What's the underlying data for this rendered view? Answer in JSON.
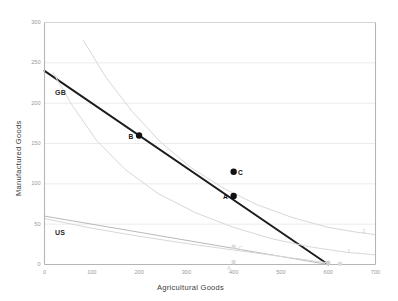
{
  "chart_data": {
    "type": "line",
    "title": "",
    "xlabel": "Agricultural Goods",
    "ylabel": "Manufactured Goods",
    "xlim": [
      0,
      700
    ],
    "ylim": [
      0,
      300
    ],
    "xticks": [
      "0",
      "100",
      "200",
      "300",
      "400",
      "500",
      "600",
      "700"
    ],
    "yticks": [
      "0",
      "50",
      "100",
      "150",
      "200",
      "250",
      "300"
    ],
    "grid": "horizontal",
    "legend": "none",
    "series": [
      {
        "name": "GB",
        "label": "GB",
        "kind": "ppf-line",
        "color": "#1c1c1c",
        "x": [
          0,
          600
        ],
        "y": [
          240,
          0
        ]
      },
      {
        "name": "US",
        "label": "US",
        "kind": "ppf-line",
        "color": "#b9b9b9",
        "x": [
          0,
          600
        ],
        "y": [
          60,
          0
        ]
      },
      {
        "name": "indifference-curve-1",
        "label": "1",
        "kind": "indifference-curve",
        "color": "#d8d8d8",
        "x": [
          18,
          60,
          110,
          170,
          240,
          320,
          400,
          480,
          560,
          640,
          700
        ],
        "y": [
          238,
          196,
          154,
          118,
          88,
          64,
          46,
          32,
          22,
          15,
          12
        ]
      },
      {
        "name": "indifference-curve-2",
        "label": "2",
        "kind": "indifference-curve",
        "color": "#d8d8d8",
        "x": [
          82,
          130,
          185,
          245,
          310,
          380,
          450,
          525,
          600,
          660,
          700
        ],
        "y": [
          278,
          232,
          190,
          152,
          120,
          94,
          74,
          58,
          46,
          40,
          37
        ]
      },
      {
        "name": "us-lower-curve",
        "label": "",
        "kind": "indifference-curve",
        "color": "#d8d8d8",
        "x": [
          0,
          100,
          200,
          300,
          400,
          500,
          600
        ],
        "y": [
          57,
          45,
          35,
          26,
          18,
          10,
          2
        ]
      }
    ],
    "points": [
      {
        "name": "point-B",
        "label": "B",
        "x": 200,
        "y": 160,
        "color": "#111111",
        "label_side": "left"
      },
      {
        "name": "point-A",
        "label": "A",
        "x": 400,
        "y": 85,
        "color": "#111111",
        "label_side": "left"
      },
      {
        "name": "point-C",
        "label": "C",
        "x": 400,
        "y": 115,
        "color": "#111111",
        "label_side": "right"
      }
    ],
    "ghost_points": [
      {
        "name": "ghost-point-C",
        "label": "C",
        "x": 400,
        "y": 22,
        "color": "#dcdcdc",
        "label_side": "right"
      },
      {
        "name": "ghost-point-A",
        "label": "A",
        "x": 400,
        "y": 3,
        "color": "#dcdcdc",
        "label_side": "below"
      },
      {
        "name": "ghost-point-origin-1",
        "label": "",
        "x": 600,
        "y": 2,
        "color": "#d0d0d0",
        "label_side": "none"
      },
      {
        "name": "ghost-point-origin-2",
        "label": "",
        "x": 625,
        "y": 1,
        "color": "#dcdcdc",
        "label_side": "none"
      }
    ],
    "curve_end_labels": [
      {
        "name": "curve-label-1",
        "label": "1",
        "x": 640,
        "y": 16
      },
      {
        "name": "curve-label-2",
        "label": "2",
        "x": 672,
        "y": 40
      }
    ]
  },
  "axes": {
    "x_title": "Agricultural Goods",
    "y_title": "Manufactured Goods"
  }
}
